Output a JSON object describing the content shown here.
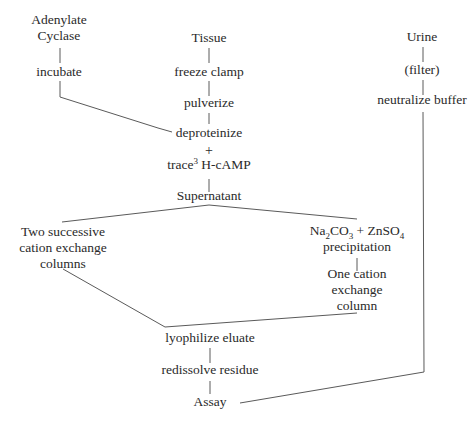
{
  "diagram": {
    "nodes": {
      "adenylate": {
        "lines": [
          "Adenylate",
          "Cyclase"
        ]
      },
      "incubate": {
        "label": "incubate"
      },
      "tissue": {
        "label": "Tissue"
      },
      "freeze_clamp": {
        "label": "freeze clamp"
      },
      "pulverize": {
        "label": "pulverize"
      },
      "deproteinize": {
        "label": "deproteinize"
      },
      "plus": {
        "label": "+"
      },
      "trace": {
        "prefix": "trace",
        "sup": "3",
        "suffix": " H-cAMP"
      },
      "supernatant": {
        "label": "Supernatant"
      },
      "urine": {
        "label": "Urine"
      },
      "filter": {
        "label": "(filter)"
      },
      "neutralize": {
        "label": "neutralize buffer"
      },
      "two_columns": {
        "lines": [
          "Two successive",
          "cation exchange",
          "columns"
        ]
      },
      "precip": {
        "na": "Na",
        "na_sub": "2",
        "co": "CO",
        "co_sub": "3",
        "plus_zn": " + ZnSO",
        "zn_sub": "4",
        "line2": "precipitation"
      },
      "one_column": {
        "lines": [
          "One cation",
          "exchange",
          "column"
        ]
      },
      "lyophilize": {
        "label": "lyophilize eluate"
      },
      "redissolve": {
        "label": "redissolve residue"
      },
      "assay": {
        "label": "Assay"
      }
    },
    "edges": [
      [
        "Adenylate Cyclase",
        "incubate"
      ],
      [
        "incubate",
        "deproteinize"
      ],
      [
        "Tissue",
        "freeze clamp"
      ],
      [
        "freeze clamp",
        "pulverize"
      ],
      [
        "pulverize",
        "deproteinize"
      ],
      [
        "trace 3H-cAMP",
        "Supernatant"
      ],
      [
        "Supernatant",
        "Two successive cation exchange columns"
      ],
      [
        "Supernatant",
        "Na2CO3 + ZnSO4 precipitation"
      ],
      [
        "Na2CO3 + ZnSO4 precipitation",
        "One cation exchange column"
      ],
      [
        "Two successive cation exchange columns",
        "lyophilize eluate"
      ],
      [
        "One cation exchange column",
        "lyophilize eluate"
      ],
      [
        "lyophilize eluate",
        "redissolve residue"
      ],
      [
        "redissolve residue",
        "Assay"
      ],
      [
        "Urine",
        "(filter)"
      ],
      [
        "(filter)",
        "neutralize buffer"
      ],
      [
        "neutralize buffer",
        "Assay"
      ]
    ]
  }
}
